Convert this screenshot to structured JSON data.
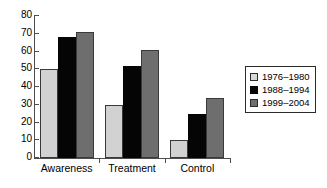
{
  "chart_data": {
    "type": "bar",
    "title": "",
    "xlabel": "",
    "ylabel": "",
    "ylim": [
      0,
      80
    ],
    "yticks": [
      0,
      10,
      20,
      30,
      40,
      50,
      60,
      70,
      80
    ],
    "ytick_labels": [
      "0",
      "10",
      "20",
      "30",
      "40",
      "50",
      "60",
      "70",
      "80"
    ],
    "grid": false,
    "legend_position": "right",
    "categories": [
      "Awareness",
      "Treatment",
      "Control"
    ],
    "series": [
      {
        "name": "1976–1980",
        "color": "#d2d2d2",
        "values": [
          50,
          30,
          10
        ]
      },
      {
        "name": "1988–1994",
        "color": "#050505",
        "values": [
          68,
          52,
          25
        ]
      },
      {
        "name": "1999–2004",
        "color": "#6e6e6e",
        "values": [
          71,
          61,
          34
        ]
      }
    ]
  }
}
